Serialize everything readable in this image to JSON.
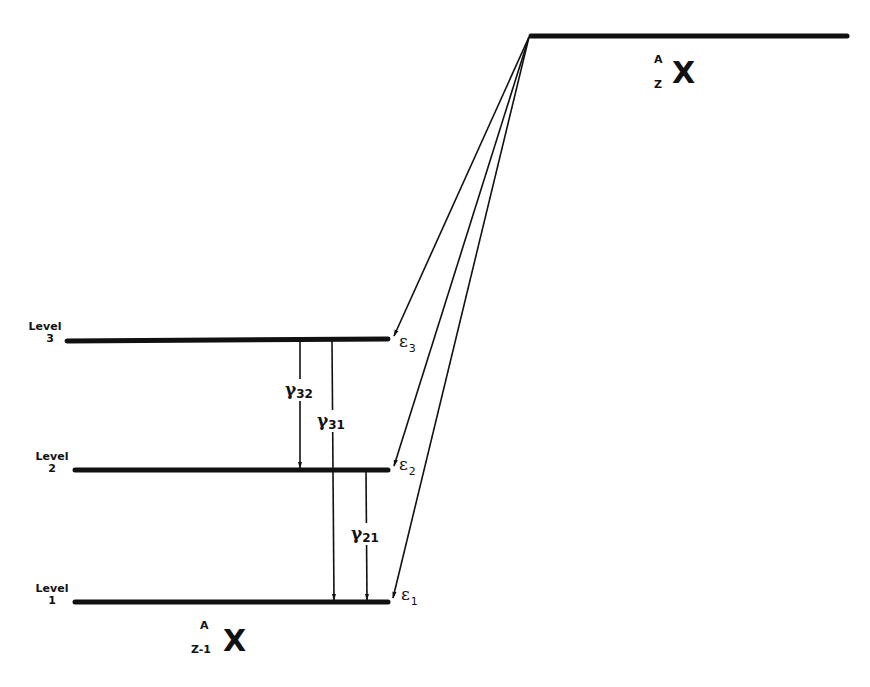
{
  "diagram": {
    "type": "energy-level-diagram",
    "parent_state": {
      "nucleus_symbol": "X",
      "mass_number": "A",
      "atomic_number": "Z"
    },
    "daughter_state": {
      "nucleus_symbol": "X",
      "mass_number": "A",
      "atomic_number": "Z-1"
    },
    "levels": [
      {
        "label": "Level",
        "number": "3"
      },
      {
        "label": "Level",
        "number": "2"
      },
      {
        "label": "Level",
        "number": "1"
      }
    ],
    "feeding_transitions": [
      {
        "symbol": "ε",
        "index": "3",
        "to_level": "3"
      },
      {
        "symbol": "ε",
        "index": "2",
        "to_level": "2"
      },
      {
        "symbol": "ε",
        "index": "1",
        "to_level": "1"
      }
    ],
    "gamma_transitions": [
      {
        "symbol": "γ",
        "index": "32",
        "from_level": "3",
        "to_level": "2"
      },
      {
        "symbol": "γ",
        "index": "31",
        "from_level": "3",
        "to_level": "1"
      },
      {
        "symbol": "γ",
        "index": "21",
        "from_level": "2",
        "to_level": "1"
      }
    ],
    "colors": {
      "line": "#111111",
      "background": "#ffffff"
    }
  }
}
